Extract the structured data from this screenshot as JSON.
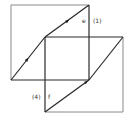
{
  "diagram": {
    "labels": {
      "top_edge_name": "e",
      "top_edge_index": "(1)",
      "bottom_edge_name": "f",
      "bottom_edge_index": "(4)"
    },
    "colors": {
      "frame_line": "#8a8a8a",
      "edge_line": "#2a2a2a",
      "background": "#ffffff"
    }
  }
}
